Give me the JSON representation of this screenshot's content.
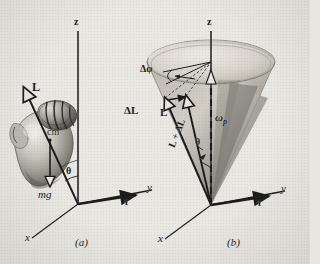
{
  "figure": {
    "background_color": "#e9e7e2",
    "ink_color": "#1b1b1b",
    "panels": [
      {
        "id": "a",
        "caption": "(a)",
        "description": "Spinning top tilted from the vertical z axis, showing angular momentum L, weight mg acting at the center of mass, and torque tau.",
        "axes": [
          {
            "name": "z-axis",
            "label": "z"
          },
          {
            "name": "y-axis",
            "label": "y"
          },
          {
            "name": "x-axis",
            "label": "x"
          },
          {
            "name": "origin",
            "label": "O"
          }
        ],
        "labels": [
          {
            "name": "angular-momentum",
            "text": "L"
          },
          {
            "name": "center-of-mass",
            "text": "cm"
          },
          {
            "name": "weight-force",
            "text": "mg"
          },
          {
            "name": "tilt-angle",
            "text": "θ"
          },
          {
            "name": "torque-vector",
            "text": "τ"
          }
        ]
      },
      {
        "id": "b",
        "caption": "(b)",
        "description": "Precession cone traced by the angular momentum vector, showing the change in L and the precession angular velocity.",
        "axes": [
          {
            "name": "z-axis",
            "label": "z"
          },
          {
            "name": "y-axis",
            "label": "y"
          },
          {
            "name": "x-axis",
            "label": "x"
          },
          {
            "name": "origin",
            "label": "O"
          }
        ],
        "labels": [
          {
            "name": "precession-angle-increment",
            "text": "Δφ"
          },
          {
            "name": "angular-momentum-change",
            "text": "ΔL"
          },
          {
            "name": "angular-momentum",
            "text": "L"
          },
          {
            "name": "angular-momentum-sum",
            "text": "L + ΔL"
          },
          {
            "name": "precession-angular-velocity",
            "text": "ωp"
          },
          {
            "name": "tilt-angle",
            "text": "θ"
          },
          {
            "name": "torque-vector",
            "text": "τ"
          }
        ]
      }
    ],
    "axis_labels": {
      "z": "z",
      "y": "y",
      "x": "x",
      "origin": "O"
    },
    "symbols": {
      "L": "L",
      "cm": "cm",
      "mg": "mg",
      "tau": "τ",
      "theta": "θ",
      "delta_phi": "Δφ",
      "delta_L": "ΔL",
      "L_plus_delta_L": "L + ΔL",
      "omega_p": "ω",
      "omega_p_sub": "p"
    },
    "captions": {
      "a": "(a)",
      "b": "(b)"
    }
  }
}
